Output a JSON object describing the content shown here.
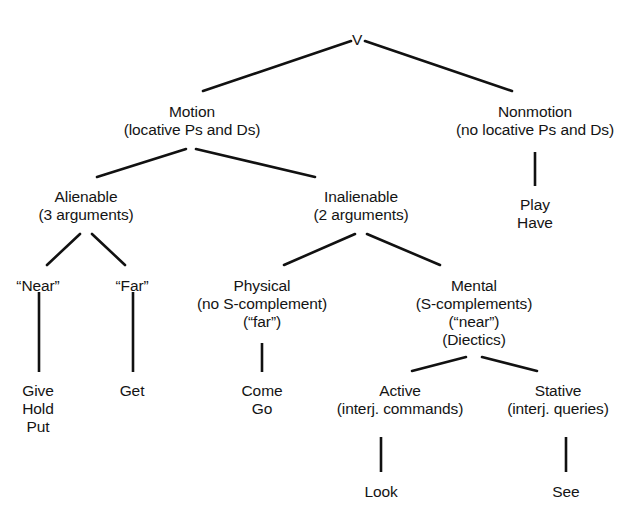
{
  "diagram": {
    "type": "tree-diagram",
    "background_color": "#ffffff",
    "line_color": "#111111",
    "text_color": "#141414",
    "nodes": [
      {
        "id": "v",
        "label_lines": [
          "V"
        ],
        "x": 357,
        "y": 31,
        "level": 0,
        "children": [
          "motion",
          "nonmotion"
        ]
      },
      {
        "id": "motion",
        "label_lines": [
          "Motion",
          "(locative Ps and Ds)"
        ],
        "x": 192,
        "y": 103,
        "level": 1,
        "children": [
          "alienable",
          "inalienable"
        ]
      },
      {
        "id": "nonmotion",
        "label_lines": [
          "Nonmotion",
          "(no locative Ps and Ds)"
        ],
        "x": 535,
        "y": 103,
        "level": 1,
        "children": [
          "play-have"
        ]
      },
      {
        "id": "play-have",
        "label_lines": [
          "Play",
          "Have"
        ],
        "x": 535,
        "y": 196,
        "level": 2,
        "children": []
      },
      {
        "id": "alienable",
        "label_lines": [
          "Alienable",
          "(3 arguments)"
        ],
        "x": 86,
        "y": 188,
        "level": 2,
        "children": [
          "near",
          "far"
        ]
      },
      {
        "id": "inalienable",
        "label_lines": [
          "Inalienable",
          "(2 arguments)"
        ],
        "x": 361,
        "y": 188,
        "level": 2,
        "children": [
          "physical",
          "mental"
        ]
      },
      {
        "id": "near",
        "label_lines": [
          "“Near”"
        ],
        "x": 38,
        "y": 277,
        "level": 3,
        "children": [
          "give-hold-put"
        ]
      },
      {
        "id": "far",
        "label_lines": [
          "“Far”"
        ],
        "x": 132,
        "y": 277,
        "level": 3,
        "children": [
          "get"
        ]
      },
      {
        "id": "physical",
        "label_lines": [
          "Physical",
          "(no S-complement)",
          "(“far”)"
        ],
        "x": 262,
        "y": 277,
        "level": 3,
        "children": [
          "come-go"
        ]
      },
      {
        "id": "mental",
        "label_lines": [
          "Mental",
          "(S-complements)",
          "(“near”)",
          "(Diectics)"
        ],
        "x": 474,
        "y": 277,
        "level": 3,
        "children": [
          "active",
          "stative"
        ]
      },
      {
        "id": "give-hold-put",
        "label_lines": [
          "Give",
          "Hold",
          "Put"
        ],
        "x": 38,
        "y": 382,
        "level": 4,
        "children": []
      },
      {
        "id": "get",
        "label_lines": [
          "Get"
        ],
        "x": 132,
        "y": 382,
        "level": 4,
        "children": []
      },
      {
        "id": "come-go",
        "label_lines": [
          "Come",
          "Go"
        ],
        "x": 262,
        "y": 382,
        "level": 4,
        "children": []
      },
      {
        "id": "active",
        "label_lines": [
          "Active",
          "(interj. commands)"
        ],
        "x": 400,
        "y": 382,
        "level": 4,
        "children": [
          "look"
        ]
      },
      {
        "id": "stative",
        "label_lines": [
          "Stative",
          "(interj. queries)"
        ],
        "x": 558,
        "y": 382,
        "level": 4,
        "children": [
          "see"
        ]
      },
      {
        "id": "look",
        "label_lines": [
          "Look"
        ],
        "x": 381,
        "y": 483,
        "level": 5,
        "children": []
      },
      {
        "id": "see",
        "label_lines": [
          "See"
        ],
        "x": 566,
        "y": 483,
        "level": 5,
        "children": []
      }
    ],
    "edges": [
      {
        "id": "edge-v-motion",
        "from": "v",
        "to": "motion",
        "kind": "diagonal",
        "x1": 351,
        "y1": 41,
        "x2": 203,
        "y2": 91
      },
      {
        "id": "edge-v-nonmotion",
        "from": "v",
        "to": "nonmotion",
        "kind": "diagonal",
        "x1": 365,
        "y1": 41,
        "x2": 512,
        "y2": 91
      },
      {
        "id": "edge-motion-alienable",
        "from": "motion",
        "to": "alienable",
        "kind": "diagonal",
        "x1": 186,
        "y1": 149,
        "x2": 97,
        "y2": 177
      },
      {
        "id": "edge-motion-inalienable",
        "from": "motion",
        "to": "inalienable",
        "kind": "diagonal",
        "x1": 196,
        "y1": 149,
        "x2": 315,
        "y2": 177
      },
      {
        "id": "edge-nonmotion-playhave",
        "from": "nonmotion",
        "to": "play-have",
        "kind": "vertical",
        "x1": 535,
        "y1": 152,
        "x2": 535,
        "y2": 186
      },
      {
        "id": "edge-alienable-near",
        "from": "alienable",
        "to": "near",
        "kind": "diagonal",
        "x1": 80,
        "y1": 234,
        "x2": 47,
        "y2": 265
      },
      {
        "id": "edge-alienable-far",
        "from": "alienable",
        "to": "far",
        "kind": "diagonal",
        "x1": 92,
        "y1": 234,
        "x2": 125,
        "y2": 265
      },
      {
        "id": "edge-inalienable-physical",
        "from": "inalienable",
        "to": "physical",
        "kind": "diagonal",
        "x1": 355,
        "y1": 234,
        "x2": 284,
        "y2": 265
      },
      {
        "id": "edge-inalienable-mental",
        "from": "inalienable",
        "to": "mental",
        "kind": "diagonal",
        "x1": 367,
        "y1": 234,
        "x2": 440,
        "y2": 265
      },
      {
        "id": "edge-near-givehold",
        "from": "near",
        "to": "give-hold-put",
        "kind": "vertical",
        "x1": 39,
        "y1": 292,
        "x2": 39,
        "y2": 372
      },
      {
        "id": "edge-far-get",
        "from": "far",
        "to": "get",
        "kind": "vertical",
        "x1": 133,
        "y1": 292,
        "x2": 133,
        "y2": 372
      },
      {
        "id": "edge-physical-comego",
        "from": "physical",
        "to": "come-go",
        "kind": "vertical",
        "x1": 262,
        "y1": 343,
        "x2": 262,
        "y2": 372
      },
      {
        "id": "edge-mental-active",
        "from": "mental",
        "to": "active",
        "kind": "diagonal",
        "x1": 466,
        "y1": 357,
        "x2": 412,
        "y2": 371
      },
      {
        "id": "edge-mental-stative",
        "from": "mental",
        "to": "stative",
        "kind": "diagonal",
        "x1": 482,
        "y1": 357,
        "x2": 537,
        "y2": 371
      },
      {
        "id": "edge-active-look",
        "from": "active",
        "to": "look",
        "kind": "vertical",
        "x1": 381,
        "y1": 437,
        "x2": 381,
        "y2": 472
      },
      {
        "id": "edge-stative-see",
        "from": "stative",
        "to": "see",
        "kind": "vertical",
        "x1": 566,
        "y1": 437,
        "x2": 566,
        "y2": 472
      }
    ]
  }
}
